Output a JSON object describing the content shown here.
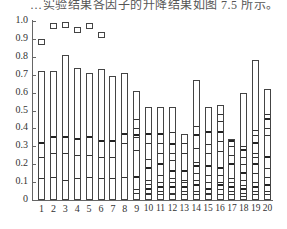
{
  "caption": "…实验结果各因子的升降结果如图 7.5 所示。",
  "chart_data": {
    "type": "bar",
    "title": "",
    "xlabel": "",
    "ylabel": "",
    "ylim": [
      0,
      1.0
    ],
    "grid": false,
    "y_ticks": [
      "0",
      "0.1",
      "0.2",
      "0.3",
      "0.4",
      "0.5",
      "0.6",
      "0.7",
      "0.8",
      "0.9",
      "1.0"
    ],
    "categories": [
      "1",
      "2",
      "3",
      "4",
      "5",
      "6",
      "7",
      "8",
      "9",
      "10",
      "11",
      "12",
      "13",
      "14",
      "15",
      "16",
      "17",
      "18",
      "19",
      "20"
    ],
    "values": [
      0.72,
      0.72,
      0.81,
      0.74,
      0.71,
      0.73,
      0.69,
      0.71,
      0.61,
      0.52,
      0.52,
      0.52,
      0.37,
      0.67,
      0.52,
      0.53,
      0.34,
      0.6,
      0.78,
      0.62
    ],
    "internal_divisions": [
      [
        0.11,
        0.23,
        0.31
      ],
      [
        0.12,
        0.25,
        0.34
      ],
      [
        0.1,
        0.25,
        0.34
      ],
      [
        0.11,
        0.24,
        0.33
      ],
      [
        0.12,
        0.24,
        0.34
      ],
      [
        0.11,
        0.23,
        0.32
      ],
      [
        0.11,
        0.23,
        0.32
      ],
      [
        0.12,
        0.31,
        0.36
      ],
      [
        0.03,
        0.05,
        0.12,
        0.27,
        0.34,
        0.35,
        0.39,
        0.44
      ],
      [
        0.02,
        0.03,
        0.05,
        0.08,
        0.1,
        0.17,
        0.22,
        0.31,
        0.36
      ],
      [
        0.02,
        0.04,
        0.06,
        0.09,
        0.13,
        0.19,
        0.25,
        0.31,
        0.36
      ],
      [
        0.02,
        0.03,
        0.06,
        0.09,
        0.11,
        0.15,
        0.21,
        0.25,
        0.3,
        0.37
      ],
      [
        0.02,
        0.04,
        0.06,
        0.09,
        0.1,
        0.15,
        0.25,
        0.31
      ],
      [
        0.02,
        0.04,
        0.07,
        0.1,
        0.14,
        0.18,
        0.2,
        0.28,
        0.35,
        0.4
      ],
      [
        0.02,
        0.03,
        0.05,
        0.09,
        0.13,
        0.18,
        0.25,
        0.3,
        0.37
      ],
      [
        0.02,
        0.05,
        0.07,
        0.09,
        0.13,
        0.17,
        0.26,
        0.32,
        0.37,
        0.43,
        0.47
      ],
      [
        0.02,
        0.04,
        0.06,
        0.09,
        0.11,
        0.19,
        0.24,
        0.29,
        0.32
      ],
      [
        0.01,
        0.03,
        0.05,
        0.07,
        0.1,
        0.14,
        0.19,
        0.23,
        0.27,
        0.29
      ],
      [
        0.02,
        0.04,
        0.06,
        0.09,
        0.14,
        0.19,
        0.23,
        0.25,
        0.31,
        0.35,
        0.38
      ],
      [
        0.02,
        0.04,
        0.07,
        0.12,
        0.17,
        0.23,
        0.35,
        0.39,
        0.44,
        0.47
      ]
    ],
    "markers": {
      "shape": "square",
      "categories": [
        "1",
        "2",
        "3",
        "4",
        "5",
        "6"
      ],
      "values": [
        0.88,
        0.97,
        0.98,
        0.95,
        0.97,
        0.92
      ]
    }
  }
}
